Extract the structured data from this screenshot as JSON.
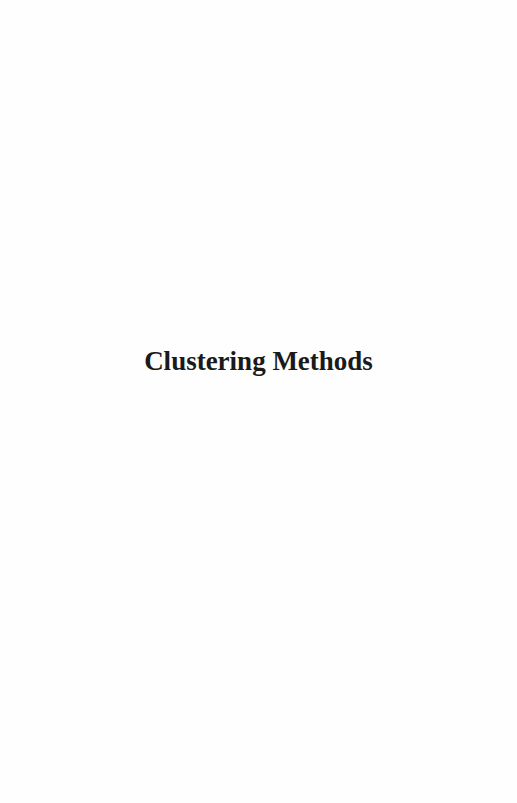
{
  "page": {
    "title": "Clustering Methods"
  }
}
